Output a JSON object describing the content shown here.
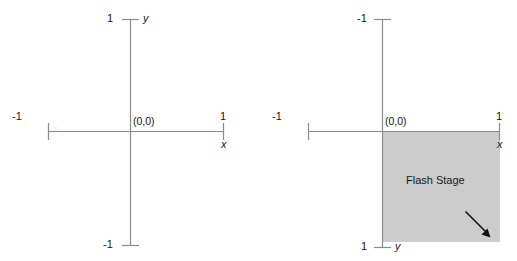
{
  "figure": {
    "title": "",
    "background_color": "#ffffff",
    "axis_color": "#8a8a8a",
    "text_color": "#161616",
    "stage_fill_color": "#cccccc",
    "arrow_color": "#111111"
  },
  "panels": [
    {
      "id": "standard-cartesian",
      "name": "left-diagram",
      "description": "standard cartesian coordinate plane",
      "axes": {
        "x_axis_label": "x",
        "y_axis_label": "y",
        "origin_label": "(0,0)",
        "x_min_tick_label": "-1",
        "x_max_tick_label": "1",
        "y_top_tick_label": "1",
        "y_bottom_tick_label": "-1"
      },
      "stage": null
    },
    {
      "id": "flash-stage-coordinates",
      "name": "right-diagram",
      "description": "flash stage coordinate plane with inverted y axis",
      "axes": {
        "x_axis_label": "x",
        "y_axis_label": "y",
        "origin_label": "(0,0)",
        "x_min_tick_label": "-1",
        "x_max_tick_label": "1",
        "y_top_tick_label": "-1",
        "y_bottom_tick_label": "1"
      },
      "stage": {
        "label": "Flash Stage",
        "fill": "#cccccc",
        "arrow_direction": "down-right"
      }
    }
  ]
}
